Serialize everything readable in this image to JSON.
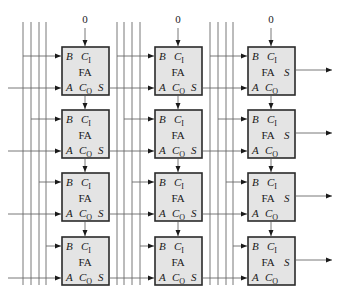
{
  "diagram": {
    "type": "array-multiplier-full-adder-grid",
    "columns": 3,
    "rows": 4,
    "cell": {
      "name": "FA",
      "ports": {
        "b": "B",
        "a": "A",
        "carry_in": "C",
        "carry_in_sub": "I",
        "carry_out": "C",
        "carry_out_sub": "O",
        "sum": "S"
      }
    },
    "top_carry_inputs": [
      "0",
      "0",
      "0"
    ],
    "colors": {
      "box_fill": "#e4e4e4",
      "box_stroke": "#2a2a2a",
      "wire": "#6a6a6a",
      "text": "#1a1a1a"
    }
  }
}
